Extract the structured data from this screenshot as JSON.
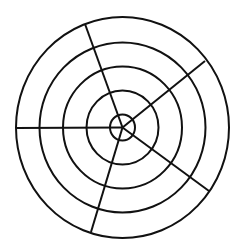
{
  "diagram": {
    "type": "concentric-circles-with-radial-spokes",
    "canvas": {
      "width": 241,
      "height": 248
    },
    "background": "#ffffff",
    "stroke_color": "#111111",
    "center": {
      "x": 122.5,
      "y": 127.5
    },
    "rings": [
      {
        "rx": 106.5,
        "ry": 110.5
      },
      {
        "rx": 83,
        "ry": 85
      },
      {
        "rx": 59.5,
        "ry": 61
      },
      {
        "rx": 36,
        "ry": 37
      },
      {
        "rx": 12.5,
        "ry": 13
      }
    ],
    "spokes": [
      {
        "x2": 85,
        "y2": 24
      },
      {
        "x2": 205,
        "y2": 61
      },
      {
        "x2": 209,
        "y2": 191
      },
      {
        "x2": 91,
        "y2": 232
      },
      {
        "x2": 16,
        "y2": 128
      }
    ]
  }
}
